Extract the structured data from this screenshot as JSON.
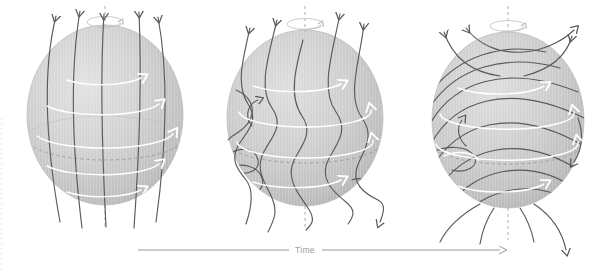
{
  "figure": {
    "background_color": "#ffffff",
    "width": 610,
    "height": 275
  },
  "timeline": {
    "label": "Time",
    "label_color": "#9b9b9b",
    "axis_color": "#8e8e8e",
    "direction": "left-to-right",
    "arrowhead": "right"
  },
  "style": {
    "sphere_fill_light": "#d9d9d9",
    "sphere_fill_mid": "#c9c9c9",
    "sphere_fill_dark": "#b4b4b4",
    "sphere_edge": "#bdbdbd",
    "fieldline_color": "#5a5a5a",
    "flow_arrow_color": "#ffffff",
    "axis_dash_color": "#b0b0b0",
    "equator_dash_color": "#9a9a9a"
  },
  "panels": [
    {
      "id": "panel-1",
      "stage": 1,
      "caption": "Initial poloidal field: meridional field lines run pole to pole, nearly straight",
      "center": {
        "x": 105,
        "y": 115
      },
      "radius": {
        "rx": 78,
        "ry": 90
      },
      "field_lines": 5,
      "field_line_shape": "meridional-straight",
      "top_arrows": 5,
      "bottom_arrows": 0,
      "flow_arrows": 5,
      "flow_arrow_direction": "east",
      "rotation_ellipse": true,
      "rotation_arrow": "counterclockwise-viewed-from-north",
      "polar_axis_dashed": true,
      "equator_dashed": true
    },
    {
      "id": "panel-2",
      "stage": 2,
      "caption": "Shearing begins: faster equatorial rotation drags field lines into S-shaped kinks",
      "center": {
        "x": 305,
        "y": 118
      },
      "radius": {
        "rx": 78,
        "ry": 88
      },
      "field_lines": 6,
      "field_line_shape": "sheared-wavy",
      "top_arrows": 4,
      "bottom_arrows": 1,
      "flow_arrows": 4,
      "flow_arrow_direction": "east",
      "rotation_ellipse": true,
      "rotation_arrow": "counterclockwise-viewed-from-north",
      "polar_axis_dashed": true,
      "equator_dashed": true
    },
    {
      "id": "panel-3",
      "stage": 3,
      "caption": "Field wound into strong toroidal bands wrapping around the equator",
      "center": {
        "x": 508,
        "y": 120
      },
      "radius": {
        "rx": 76,
        "ry": 88
      },
      "field_lines": 7,
      "field_line_shape": "toroidal-wrapped",
      "top_arrows": 4,
      "bottom_arrows": 3,
      "flow_arrows": 4,
      "flow_arrow_direction": "east",
      "rotation_ellipse": true,
      "rotation_arrow": "counterclockwise-viewed-from-north",
      "polar_axis_dashed": true,
      "equator_dashed": true
    }
  ]
}
